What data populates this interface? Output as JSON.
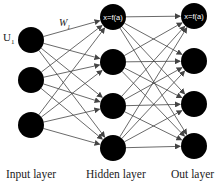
{
  "diagram": {
    "type": "neural-network",
    "colors": {
      "node": "#000000",
      "edge": "#444444",
      "text": "#222222",
      "background": "#ffffff"
    },
    "input_label": "U1",
    "weight_label": "W",
    "node_formula": "x=f(a)",
    "layers": [
      {
        "name": "Input layer",
        "x": 31,
        "nodes": [
          40,
          80,
          125
        ]
      },
      {
        "name": "Hidden layer",
        "x": 113,
        "nodes": [
          17,
          62,
          106,
          148
        ]
      },
      {
        "name": "Out layer",
        "x": 194,
        "nodes": [
          16,
          61,
          104,
          146
        ]
      }
    ],
    "labels": {
      "input_layer": "Input layer",
      "hidden_layer": "Hidden layer",
      "out_layer": "Out layer",
      "hidden_top": "x=f(a)",
      "out_top": "x=f(a)",
      "u1": "U",
      "u1_sub": "1",
      "w": "W",
      "w_sub": "1"
    }
  }
}
